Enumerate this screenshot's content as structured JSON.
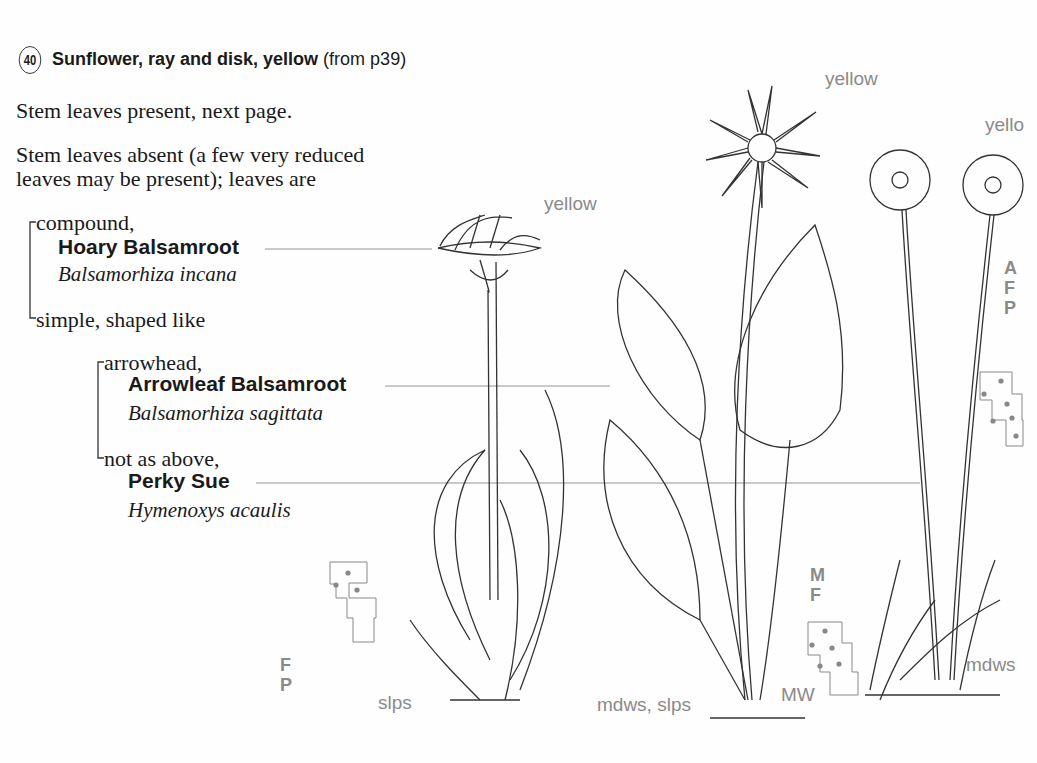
{
  "header": {
    "number": "40",
    "title": "Sunflower, ray and disk, yellow",
    "ref": "(from p39)"
  },
  "key": {
    "line1": "Stem leaves present, next page.",
    "line2a": "Stem leaves absent (a few very reduced",
    "line2b": "leaves may be present); leaves are",
    "compound": "compound,",
    "simple": "simple, shaped like",
    "arrowhead": "arrowhead,",
    "not_above": "not as above,"
  },
  "species": [
    {
      "common": "Hoary Balsamroot",
      "scientific": "Balsamorhiza incana",
      "color": "yellow",
      "habitat": "slps",
      "codes": [
        "F",
        "P"
      ]
    },
    {
      "common": "Arrowleaf Balsamroot",
      "scientific": "Balsamorhiza sagittata",
      "color": "yellow",
      "habitat": "mdws, slps",
      "codes": [
        "M",
        "F"
      ],
      "extra": "MW"
    },
    {
      "common": "Perky Sue",
      "scientific": "Hymenoxys acaulis",
      "color": "yellow",
      "habitat": "mdws",
      "codes": [
        "A",
        "F",
        "P"
      ]
    }
  ],
  "labels": {
    "yellow_partial": "yello"
  }
}
